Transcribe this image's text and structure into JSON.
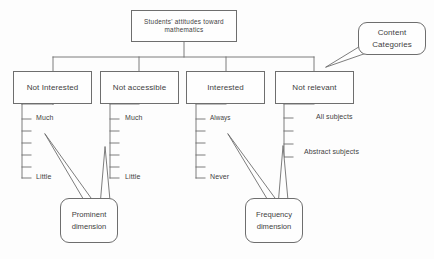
{
  "diagram": {
    "root": {
      "label": "Students' attitudes toward mathematics"
    },
    "categories_callout": {
      "label": "Content Categories"
    },
    "branches": [
      {
        "label": "Not Interested",
        "scale": {
          "top_label": "Much",
          "bottom_label": "Little",
          "ticks": 6
        }
      },
      {
        "label": "Not accessible",
        "scale": {
          "top_label": "Much",
          "bottom_label": "Little",
          "ticks": 6
        }
      },
      {
        "label": "Interested",
        "scale": {
          "top_label": "Always",
          "bottom_label": "Never",
          "ticks": 6
        }
      },
      {
        "label": "Not relevant",
        "scale": {
          "top_label": "All subjects",
          "bottom_label": "Abstract subjects",
          "ticks": 4
        }
      }
    ],
    "dimension_callouts": [
      {
        "line1": "Prominent",
        "line2": "dimension"
      },
      {
        "line1": "Frequency",
        "line2": "dimension"
      }
    ],
    "colors": {
      "stroke": "#6e6e6e",
      "text": "#3f3f3f",
      "background": "#fdfdfd"
    }
  }
}
